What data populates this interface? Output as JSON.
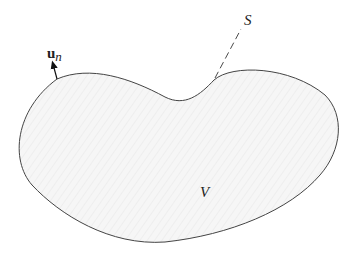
{
  "diagram": {
    "region_label": "V",
    "surface_label": "S",
    "normal_label": {
      "base": "u",
      "subscript": "n"
    },
    "colors": {
      "outline": "#444444",
      "fill": "#f4f4f4",
      "text": "#222222"
    }
  }
}
